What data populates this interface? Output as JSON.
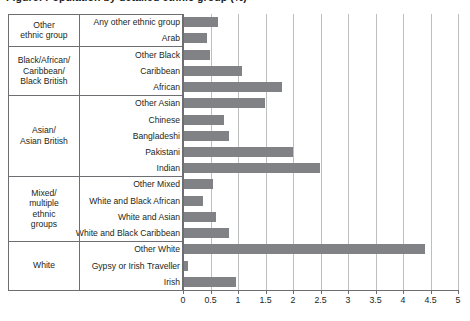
{
  "chart_data": {
    "type": "bar",
    "orientation": "horizontal",
    "title": "Figure: Population by detailed ethnic group (%)",
    "xlabel": "",
    "ylabel": "",
    "xlim": [
      0,
      5
    ],
    "xticks": [
      "0",
      "0.5",
      "1",
      "1.5",
      "2",
      "2.5",
      "3",
      "3.5",
      "4",
      "4.5",
      "5"
    ],
    "xtick_values": [
      0,
      0.5,
      1,
      1.5,
      2,
      2.5,
      3,
      3.5,
      4,
      4.5,
      5
    ],
    "grid": true,
    "legend": "none",
    "bar_color": "#808285",
    "gridline_color": "#bcbec0",
    "axis_color": "#6d6e71",
    "categories": [
      "Any other ethnic group",
      "Arab",
      "Other Black",
      "Caribbean",
      "African",
      "Other Asian",
      "Chinese",
      "Bangladeshi",
      "Pakistani",
      "Indian",
      "Other Mixed",
      "White and Black African",
      "White and Asian",
      "White and Black Caribbean",
      "Other White",
      "Gypsy or Irish Traveller",
      "Irish"
    ],
    "values": [
      0.62,
      0.42,
      0.47,
      1.05,
      1.78,
      1.48,
      0.72,
      0.82,
      1.98,
      2.47,
      0.52,
      0.35,
      0.58,
      0.82,
      4.38,
      0.07,
      0.94
    ],
    "groups": [
      {
        "label": "Other\nethnic group",
        "categories": [
          "Any other ethnic group",
          "Arab"
        ]
      },
      {
        "label": "Black/African/\nCaribbean/\nBlack British",
        "categories": [
          "Other Black",
          "Caribbean",
          "African"
        ]
      },
      {
        "label": "Asian/\nAsian British",
        "categories": [
          "Other Asian",
          "Chinese",
          "Bangladeshi",
          "Pakistani",
          "Indian"
        ]
      },
      {
        "label": "Mixed/\nmultiple\nethnic\ngroups",
        "categories": [
          "Other Mixed",
          "White and Black African",
          "White and Asian",
          "White and Black Caribbean"
        ]
      },
      {
        "label": "White",
        "categories": [
          "Other White",
          "Gypsy or Irish Traveller",
          "Irish"
        ]
      }
    ]
  },
  "group_labels": [
    "Other ethnic group",
    "Black/African/ Caribbean/ Black British",
    "Asian/ Asian British",
    "Mixed/ multiple ethnic groups",
    "White"
  ]
}
